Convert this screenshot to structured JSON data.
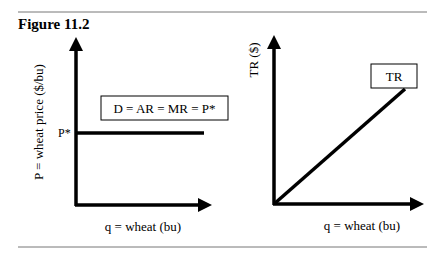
{
  "figure": {
    "title": "Figure 11.2"
  },
  "chart_data": [
    {
      "type": "line",
      "title": "",
      "xlabel": "q = wheat (bu)",
      "ylabel": "P = wheat price ($/bu)",
      "y_tick_labels": [
        "P*"
      ],
      "series": [
        {
          "name": "D = AR = MR = P*",
          "shape": "horizontal",
          "y": "P*",
          "x": [
            0,
            1
          ]
        }
      ],
      "annotations": [
        "D = AR = MR = P*"
      ],
      "grid": false
    },
    {
      "type": "line",
      "title": "",
      "xlabel": "q = wheat (bu)",
      "ylabel": "TR ($)",
      "series": [
        {
          "name": "TR",
          "shape": "linear from origin",
          "x": [
            0,
            1
          ],
          "y": [
            0,
            1
          ]
        }
      ],
      "annotations": [
        "TR"
      ],
      "grid": false
    }
  ]
}
